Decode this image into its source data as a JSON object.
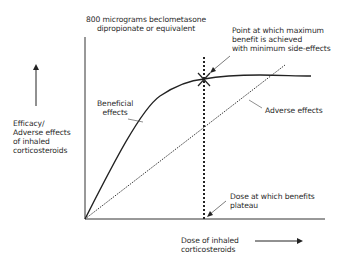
{
  "diagram": {
    "y_axis_label": [
      "Efficacy/",
      "Adverse effects",
      "of inhaled",
      "corticosteroids"
    ],
    "x_axis_label": [
      "Dose of inhaled",
      "corticosteroids"
    ],
    "top_label": [
      "800 micrograms beclometasone",
      "dipropionate or equivalent"
    ],
    "point_label": [
      "Point at which maximum",
      "benefit is achieved",
      "with minimum side-effects"
    ],
    "beneficial_label": [
      "Beneficial",
      "effects"
    ],
    "adverse_label": "Adverse effects",
    "plateau_label": [
      "Dose at which benefits",
      "plateau"
    ],
    "curves": [
      {
        "name": "Beneficial effects",
        "style": "solid",
        "shape": "rises steeply then plateaus"
      },
      {
        "name": "Adverse effects",
        "style": "dotted",
        "shape": "linear increase"
      }
    ],
    "markers": [
      {
        "name": "optimal point",
        "symbol": "X",
        "position": "intersection of dotted vertical line and beneficial curve"
      }
    ],
    "colors": {
      "line": "#222222",
      "background": "#ffffff"
    }
  }
}
